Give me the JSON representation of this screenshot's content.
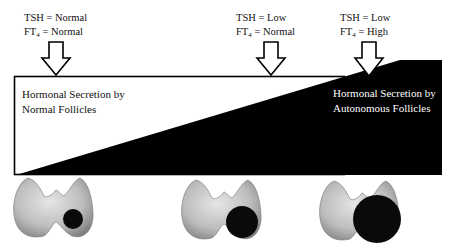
{
  "stages": [
    {
      "tsh_label": "TSH = Normal",
      "ft4_prefix": "FT",
      "ft4_sub": "4",
      "ft4_value": " = Normal",
      "nodule_size": "small"
    },
    {
      "tsh_label": "TSH = Low",
      "ft4_prefix": "FT",
      "ft4_sub": "4",
      "ft4_value": " = Normal",
      "nodule_size": "medium"
    },
    {
      "tsh_label": "TSH = Low",
      "ft4_prefix": "FT",
      "ft4_sub": "4",
      "ft4_value": " = High",
      "nodule_size": "large"
    }
  ],
  "regions": {
    "normal": {
      "line1": "Hormonal Secretion by",
      "line2": "Normal Follicles"
    },
    "autonomous": {
      "line1": "Hormonal Secretion by",
      "line2": "Autonomous Follicles"
    }
  },
  "colors": {
    "autonomous_fill": "#000000",
    "normal_fill": "#ffffff",
    "thyroid": "#b8b8b8",
    "nodule": "#0a0a0a"
  }
}
